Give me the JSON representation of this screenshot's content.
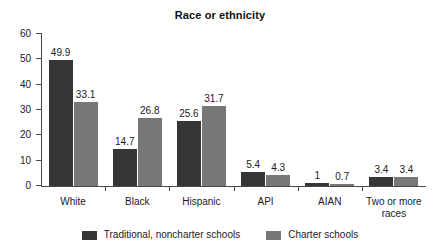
{
  "chart_data": {
    "type": "bar",
    "title": "Race or ethnicity",
    "xlabel": "",
    "ylabel": "",
    "ylim": [
      0,
      60
    ],
    "yticks": [
      "0",
      "10",
      "20",
      "30",
      "40",
      "50",
      "60"
    ],
    "grid": false,
    "legend_position": "bottom",
    "categories": [
      "White",
      "Black",
      "Hispanic",
      "API",
      "AIAN",
      "Two or more\nraces"
    ],
    "series": [
      {
        "name": "Traditional, noncharter schools",
        "color": "#363636",
        "values": [
          49.9,
          14.7,
          25.6,
          5.4,
          1,
          3.4
        ],
        "labels": [
          "49.9",
          "14.7",
          "25.6",
          "5.4",
          "1",
          "3.4"
        ]
      },
      {
        "name": "Charter schools",
        "color": "#787878",
        "values": [
          33.1,
          26.8,
          31.7,
          4.3,
          0.7,
          3.4
        ],
        "labels": [
          "33.1",
          "26.8",
          "31.7",
          "4.3",
          "0.7",
          "3.4"
        ]
      }
    ]
  },
  "colors": {
    "traditional": "#363636",
    "charter": "#787878",
    "axis": "#4a4a4a",
    "text": "#1a1a1a",
    "background": "#ffffff"
  }
}
